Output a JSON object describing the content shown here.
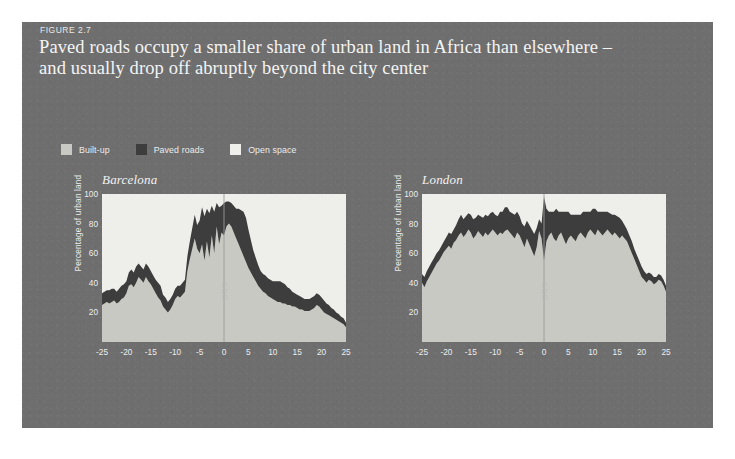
{
  "figure": {
    "label": "FIGURE 2.7",
    "title_line1": "Paved roads occupy a smaller share of urban land in Africa than elsewhere –",
    "title_line2": "and usually drop off abruptly beyond the city center"
  },
  "colors": {
    "panel_background": "#6e6e6e",
    "page_background": "#ffffff",
    "built_up": "#c9c9c4",
    "paved_roads": "#3d3d3d",
    "open_space": "#eeeeea",
    "title_text": "#f4f4f4",
    "axis_text": "#ededed",
    "cbd_line": "#9a9a9a"
  },
  "legend": {
    "items": [
      {
        "label": "Built-up",
        "swatch": "#c9c9c4",
        "icon": "legend-swatch-icon"
      },
      {
        "label": "Paved roads",
        "swatch": "#3d3d3d",
        "icon": "legend-swatch-icon"
      },
      {
        "label": "Open space",
        "swatch": "#eeeeea",
        "icon": "legend-swatch-icon"
      }
    ]
  },
  "chart_data": [
    {
      "type": "area",
      "title": "Barcelona",
      "xlabel": "",
      "ylabel": "Percentage of urban land",
      "xlim": [
        -25,
        25
      ],
      "ylim": [
        0,
        100
      ],
      "xticks": [
        -25,
        -20,
        -15,
        -10,
        -5,
        0,
        5,
        10,
        15,
        20,
        25
      ],
      "xticklabels": [
        "-25",
        "-20",
        "-15",
        "-10",
        "-5",
        "0",
        "5",
        "10",
        "15",
        "20",
        "25"
      ],
      "yticks": [
        20,
        40,
        60,
        80,
        100
      ],
      "yticklabels": [
        "20",
        "40",
        "60",
        "80",
        "100"
      ],
      "grid": false,
      "legend_position": "above-figure",
      "annotation": "CBD",
      "annotation_x": 0,
      "stacked": true,
      "x": [
        -25,
        -24.5,
        -24,
        -23.5,
        -23,
        -22.5,
        -22,
        -21.5,
        -21,
        -20.5,
        -20,
        -19.5,
        -19,
        -18.5,
        -18,
        -17.5,
        -17,
        -16.5,
        -16,
        -15.5,
        -15,
        -14.5,
        -14,
        -13.5,
        -13,
        -12.5,
        -12,
        -11.5,
        -11,
        -10.5,
        -10,
        -9.5,
        -9,
        -8.5,
        -8,
        -7.5,
        -7,
        -6.5,
        -6,
        -5.5,
        -5,
        -4.5,
        -4,
        -3.5,
        -3,
        -2.5,
        -2,
        -1.5,
        -1,
        -0.5,
        0,
        0.5,
        1,
        1.5,
        2,
        2.5,
        3,
        3.5,
        4,
        4.5,
        5,
        5.5,
        6,
        6.5,
        7,
        7.5,
        8,
        8.5,
        9,
        9.5,
        10,
        10.5,
        11,
        11.5,
        12,
        12.5,
        13,
        13.5,
        14,
        14.5,
        15,
        15.5,
        16,
        16.5,
        17,
        17.5,
        18,
        18.5,
        19,
        19.5,
        20,
        20.5,
        21,
        21.5,
        22,
        22.5,
        23,
        23.5,
        24,
        24.5,
        25
      ],
      "series": [
        {
          "name": "Built-up",
          "values": [
            25,
            26,
            27,
            26,
            27,
            28,
            26,
            27,
            29,
            30,
            33,
            38,
            39,
            37,
            40,
            44,
            42,
            40,
            44,
            41,
            39,
            36,
            33,
            30,
            28,
            24,
            22,
            20,
            22,
            25,
            29,
            31,
            30,
            32,
            34,
            48,
            56,
            63,
            70,
            63,
            60,
            66,
            55,
            68,
            57,
            72,
            60,
            78,
            66,
            74,
            72,
            78,
            80,
            78,
            74,
            70,
            66,
            62,
            58,
            54,
            50,
            47,
            44,
            41,
            38,
            36,
            34,
            33,
            31,
            30,
            29,
            28,
            27,
            27,
            26,
            26,
            25,
            25,
            24,
            24,
            23,
            22,
            22,
            21,
            21,
            21,
            22,
            23,
            25,
            24,
            22,
            20,
            19,
            18,
            17,
            16,
            15,
            14,
            13,
            12,
            10
          ]
        },
        {
          "name": "Paved roads",
          "values": [
            8,
            8,
            8,
            9,
            9,
            8,
            8,
            9,
            9,
            9,
            8,
            9,
            10,
            10,
            11,
            9,
            9,
            9,
            9,
            10,
            9,
            9,
            9,
            10,
            10,
            8,
            8,
            7,
            7,
            7,
            7,
            7,
            8,
            8,
            8,
            10,
            12,
            14,
            16,
            16,
            22,
            25,
            30,
            22,
            30,
            20,
            28,
            16,
            25,
            18,
            22,
            17,
            15,
            16,
            18,
            20,
            24,
            27,
            30,
            30,
            26,
            22,
            18,
            16,
            14,
            12,
            12,
            12,
            12,
            12,
            12,
            13,
            14,
            14,
            14,
            13,
            12,
            11,
            10,
            9,
            9,
            9,
            8,
            8,
            8,
            8,
            8,
            8,
            8,
            8,
            8,
            8,
            7,
            7,
            6,
            6,
            5,
            5,
            4,
            4,
            3
          ]
        }
      ]
    },
    {
      "type": "area",
      "title": "London",
      "xlabel": "",
      "ylabel": "Percentage of urban land",
      "xlim": [
        -25,
        25
      ],
      "ylim": [
        0,
        100
      ],
      "xticks": [
        -25,
        -20,
        -15,
        -10,
        -5,
        0,
        5,
        10,
        15,
        20,
        25
      ],
      "xticklabels": [
        "-25",
        "-20",
        "-15",
        "-10",
        "-5",
        "0",
        "5",
        "10",
        "15",
        "20",
        "25"
      ],
      "yticks": [
        20,
        40,
        60,
        80,
        100
      ],
      "yticklabels": [
        "20",
        "40",
        "60",
        "80",
        "100"
      ],
      "grid": false,
      "legend_position": "above-figure",
      "annotation": "CBD",
      "annotation_x": 0,
      "stacked": true,
      "x": [
        -25,
        -24.5,
        -24,
        -23.5,
        -23,
        -22.5,
        -22,
        -21.5,
        -21,
        -20.5,
        -20,
        -19.5,
        -19,
        -18.5,
        -18,
        -17.5,
        -17,
        -16.5,
        -16,
        -15.5,
        -15,
        -14.5,
        -14,
        -13.5,
        -13,
        -12.5,
        -12,
        -11.5,
        -11,
        -10.5,
        -10,
        -9.5,
        -9,
        -8.5,
        -8,
        -7.5,
        -7,
        -6.5,
        -6,
        -5.5,
        -5,
        -4.5,
        -4,
        -3.5,
        -3,
        -2.5,
        -2,
        -1.5,
        -1,
        -0.5,
        0,
        0.5,
        1,
        1.5,
        2,
        2.5,
        3,
        3.5,
        4,
        4.5,
        5,
        5.5,
        6,
        6.5,
        7,
        7.5,
        8,
        8.5,
        9,
        9.5,
        10,
        10.5,
        11,
        11.5,
        12,
        12.5,
        13,
        13.5,
        14,
        14.5,
        15,
        15.5,
        16,
        16.5,
        17,
        17.5,
        18,
        18.5,
        19,
        19.5,
        20,
        20.5,
        21,
        21.5,
        22,
        22.5,
        23,
        23.5,
        24,
        24.5,
        25
      ],
      "series": [
        {
          "name": "Built-up",
          "values": [
            40,
            37,
            41,
            44,
            47,
            50,
            53,
            55,
            58,
            61,
            63,
            65,
            63,
            67,
            69,
            72,
            74,
            71,
            73,
            76,
            74,
            70,
            72,
            75,
            73,
            71,
            74,
            72,
            74,
            76,
            74,
            72,
            74,
            73,
            75,
            76,
            74,
            72,
            70,
            74,
            72,
            68,
            64,
            70,
            66,
            62,
            58,
            64,
            75,
            70,
            55,
            68,
            72,
            74,
            70,
            68,
            72,
            74,
            70,
            66,
            70,
            72,
            70,
            68,
            72,
            74,
            72,
            70,
            74,
            76,
            74,
            72,
            76,
            74,
            72,
            74,
            76,
            74,
            72,
            74,
            72,
            70,
            72,
            70,
            68,
            64,
            60,
            56,
            52,
            48,
            44,
            42,
            40,
            42,
            41,
            39,
            40,
            42,
            41,
            38,
            34
          ]
        },
        {
          "name": "Paved roads",
          "values": [
            6,
            7,
            7,
            7,
            7,
            7,
            7,
            7,
            7,
            7,
            8,
            9,
            10,
            9,
            10,
            11,
            12,
            12,
            12,
            11,
            12,
            13,
            12,
            11,
            12,
            13,
            12,
            13,
            13,
            12,
            12,
            13,
            14,
            15,
            16,
            15,
            14,
            15,
            16,
            14,
            13,
            12,
            14,
            12,
            13,
            14,
            15,
            13,
            8,
            10,
            43,
            22,
            16,
            14,
            18,
            22,
            16,
            14,
            18,
            22,
            18,
            14,
            16,
            18,
            14,
            12,
            16,
            18,
            14,
            12,
            16,
            18,
            12,
            14,
            16,
            14,
            12,
            13,
            14,
            12,
            13,
            14,
            10,
            9,
            8,
            8,
            8,
            7,
            7,
            7,
            7,
            6,
            6,
            5,
            5,
            5,
            4,
            4,
            4,
            4,
            4
          ]
        }
      ]
    }
  ]
}
